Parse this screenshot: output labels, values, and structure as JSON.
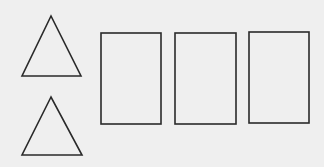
{
  "canvas": {
    "width": 324,
    "height": 167,
    "background": "#efefef",
    "stroke": "#2a2a2a"
  },
  "shapes": {
    "triangles": [
      {
        "points": "51,16 22,76 81,76"
      },
      {
        "points": "51,97 22,155 82,155"
      }
    ],
    "rectangles": [
      {
        "x": 101,
        "y": 33,
        "width": 60,
        "height": 91
      },
      {
        "x": 175,
        "y": 33,
        "width": 61,
        "height": 91
      },
      {
        "x": 249,
        "y": 32,
        "width": 60,
        "height": 91
      }
    ]
  }
}
